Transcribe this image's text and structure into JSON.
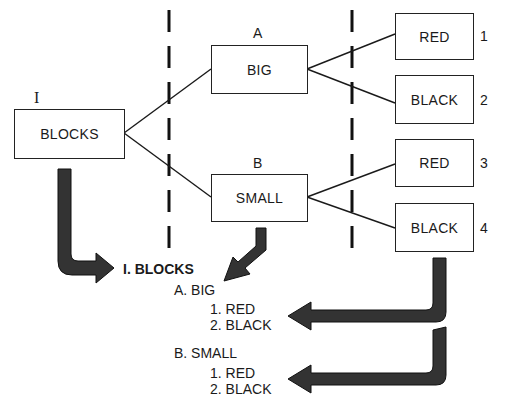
{
  "diagram": {
    "type": "tree-to-outline",
    "tree": {
      "root": {
        "numeral": "I",
        "label": "BLOCKS"
      },
      "level2": [
        {
          "letter": "A",
          "label": "BIG"
        },
        {
          "letter": "B",
          "label": "SMALL"
        }
      ],
      "level3": [
        {
          "number": "1",
          "label": "RED"
        },
        {
          "number": "2",
          "label": "BLACK"
        },
        {
          "number": "3",
          "label": "RED"
        },
        {
          "number": "4",
          "label": "BLACK"
        }
      ]
    },
    "outline": {
      "root": "I. BLOCKS",
      "a": "A. BIG",
      "a1": "1.  RED",
      "a2": "2.  BLACK",
      "b": "B. SMALL",
      "b1": "1.  RED",
      "b2": "2.  BLACK"
    },
    "colors": {
      "line": "#1a1a1a",
      "arrow_fill": "#3a3a3a",
      "arrow_edge": "#111111",
      "background": "#ffffff"
    }
  }
}
